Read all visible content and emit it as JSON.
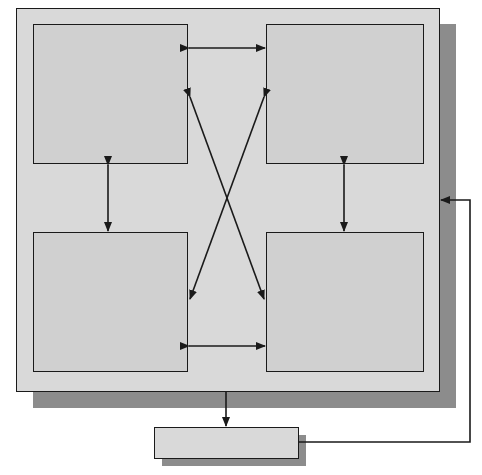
{
  "diagram": {
    "type": "block-diagram",
    "colors": {
      "background": "#ffffff",
      "container_fill": "#d9d9d9",
      "block_fill": "#d0d0d0",
      "shadow": "#8c8c8c",
      "stroke": "#1a1a1a"
    },
    "container": {
      "label": ""
    },
    "blocks": [
      {
        "id": "top-left",
        "label": ""
      },
      {
        "id": "top-right",
        "label": ""
      },
      {
        "id": "bottom-left",
        "label": ""
      },
      {
        "id": "bottom-right",
        "label": ""
      },
      {
        "id": "output",
        "label": ""
      }
    ],
    "connections": [
      {
        "from": "top-left",
        "to": "top-right",
        "bidirectional": true
      },
      {
        "from": "bottom-left",
        "to": "bottom-right",
        "bidirectional": true
      },
      {
        "from": "top-left",
        "to": "bottom-left",
        "bidirectional": true
      },
      {
        "from": "top-right",
        "to": "bottom-right",
        "bidirectional": true
      },
      {
        "from": "top-left",
        "to": "bottom-right",
        "bidirectional": true
      },
      {
        "from": "top-right",
        "to": "bottom-left",
        "bidirectional": true
      },
      {
        "from": "container",
        "to": "output",
        "bidirectional": false
      },
      {
        "from": "output",
        "to": "container",
        "bidirectional": false,
        "kind": "feedback"
      }
    ]
  }
}
